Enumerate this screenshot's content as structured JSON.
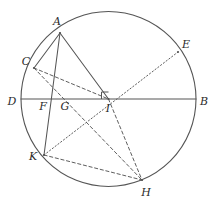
{
  "figure": {
    "kind": "geometry-diagram",
    "width": 217,
    "height": 211,
    "background_color": "#ffffff",
    "stroke_color": "#555555",
    "label_color": "#2b2b2b"
  },
  "circle": {
    "label": "circle",
    "cx": 108.5,
    "cy": 99,
    "r": 87.5,
    "stroke": "#555555",
    "stroke_width": 1.1,
    "fill": "none"
  },
  "points": [
    {
      "id": "A",
      "label": "A",
      "x": 60,
      "y": 33,
      "label_x": 57,
      "label_y": 21
    },
    {
      "id": "E",
      "label": "E",
      "x": 178,
      "y": 52,
      "label_x": 186,
      "label_y": 44
    },
    {
      "id": "C",
      "label": "C",
      "x": 34,
      "y": 68,
      "label_x": 26,
      "label_y": 61
    },
    {
      "id": "D",
      "label": "D",
      "x": 21,
      "y": 99,
      "label_x": 12,
      "label_y": 101
    },
    {
      "id": "B",
      "label": "B",
      "x": 196,
      "y": 99,
      "label_x": 204,
      "label_y": 101
    },
    {
      "id": "F",
      "label": "F",
      "x": 49,
      "y": 99,
      "label_x": 43,
      "label_y": 106
    },
    {
      "id": "G",
      "label": "G",
      "x": 70,
      "y": 99,
      "label_x": 65,
      "label_y": 106
    },
    {
      "id": "I",
      "label": "I",
      "x": 108.5,
      "y": 99,
      "label_x": 108,
      "label_y": 108
    },
    {
      "id": "K",
      "label": "K",
      "x": 44,
      "y": 155,
      "label_x": 33,
      "label_y": 156
    },
    {
      "id": "H",
      "label": "H",
      "x": 142,
      "y": 180,
      "label_x": 146,
      "label_y": 192
    }
  ],
  "segments": [
    {
      "id": "DB",
      "from": "D",
      "to": "B",
      "style": "solid",
      "note": "diameter through center I"
    },
    {
      "id": "AI",
      "from": "A",
      "to": "I",
      "style": "solid",
      "note": "radius from A to center"
    },
    {
      "id": "AK",
      "from": "A",
      "to": "K",
      "style": "solid",
      "note": "chord A to K crossing DB at F"
    },
    {
      "id": "CA",
      "from": "C",
      "to": "A",
      "style": "solid",
      "note": "arc-side chord C to A"
    },
    {
      "id": "CI",
      "from": "C",
      "to": "I",
      "style": "dashed",
      "note": "radius from C to center"
    },
    {
      "id": "CH",
      "from": "C",
      "to": "H",
      "style": "dashed",
      "note": "chord C to H crossing DB near G"
    },
    {
      "id": "IH",
      "from": "I",
      "to": "H",
      "style": "dashed",
      "note": "radius from center to H"
    },
    {
      "id": "KH",
      "from": "K",
      "to": "H",
      "style": "dashed",
      "note": "chord K to H"
    },
    {
      "id": "KE",
      "from": "K",
      "to": "E",
      "style": "dotted",
      "note": "diameter-like chord K through I to E"
    }
  ],
  "right_angle_mark": {
    "label": "right-angle-mark-at-I",
    "vertex_x": 108.5,
    "vertex_y": 99,
    "size": 7,
    "orientation": "up-left"
  }
}
